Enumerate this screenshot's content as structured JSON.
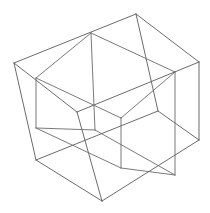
{
  "figure": {
    "type": "line-drawing",
    "background_color": "#ffffff",
    "stroke_color": "#5a5a5a",
    "stroke_color_secondary": "#6a6a6a",
    "stroke_width": 0.9,
    "canvas": {
      "width": 210,
      "height": 213
    },
    "shapes": [
      {
        "name": "cube-a",
        "label": "Outer cube",
        "stroke": "#5a5a5a",
        "vertices": {
          "v0": [
            14,
            63
          ],
          "v1": [
            136,
            14
          ],
          "v2": [
            199,
            62
          ],
          "v3": [
            77,
            112
          ],
          "v4": [
            36,
            160
          ],
          "v5": [
            158,
            111
          ],
          "v6": [
            199,
            140
          ],
          "v7": [
            102,
            201
          ]
        },
        "edges": [
          [
            "v0",
            "v1"
          ],
          [
            "v1",
            "v2"
          ],
          [
            "v2",
            "v3"
          ],
          [
            "v3",
            "v0"
          ],
          [
            "v0",
            "v4"
          ],
          [
            "v1",
            "v5"
          ],
          [
            "v2",
            "v6"
          ],
          [
            "v3",
            "v7"
          ],
          [
            "v4",
            "v5"
          ],
          [
            "v5",
            "v6"
          ],
          [
            "v6",
            "v7"
          ],
          [
            "v7",
            "v4"
          ]
        ]
      },
      {
        "name": "cube-b",
        "label": "Inner rotated cube",
        "stroke": "#6a6a6a",
        "vertices": {
          "w0": [
            36,
            78
          ],
          "w1": [
            91,
            33
          ],
          "w2": [
            175,
            72
          ],
          "w3": [
            121,
            118
          ],
          "w4": [
            36,
            128
          ],
          "w5": [
            95,
            130
          ],
          "w6": [
            175,
            175
          ],
          "w7": [
            121,
            168
          ]
        },
        "edges": [
          [
            "w0",
            "w1"
          ],
          [
            "w1",
            "w2"
          ],
          [
            "w2",
            "w3"
          ],
          [
            "w3",
            "w0"
          ],
          [
            "w0",
            "w4"
          ],
          [
            "w1",
            "w5"
          ],
          [
            "w2",
            "w6"
          ],
          [
            "w3",
            "w7"
          ],
          [
            "w4",
            "w5"
          ],
          [
            "w5",
            "w6"
          ],
          [
            "w6",
            "w7"
          ],
          [
            "w7",
            "w4"
          ]
        ]
      }
    ]
  }
}
